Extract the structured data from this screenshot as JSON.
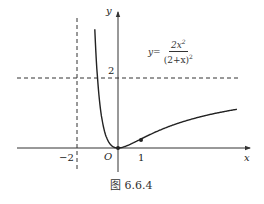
{
  "figure": {
    "caption": "图 6.6.4",
    "x_axis_label": "x",
    "y_axis_label": "y",
    "origin_label": "O",
    "tick_labels": {
      "x_neg2": "−2",
      "x_1": "1",
      "y_2": "2"
    },
    "formula": {
      "lhs": "y=",
      "numerator": "2x",
      "numerator_exp": "2",
      "denominator": "(2+x)",
      "denominator_exp": "2"
    },
    "colors": {
      "curve": "#222222",
      "axes": "#333333",
      "asymptote": "#333333"
    }
  },
  "chart_data": {
    "type": "line",
    "title": "",
    "caption": "图 6.6.4",
    "function": "y = 2x^2/(2+x)^2",
    "xlabel": "x",
    "ylabel": "y",
    "x_ticks": [
      -2,
      0,
      1
    ],
    "y_ticks": [
      2
    ],
    "asymptotes": {
      "vertical": [
        -2
      ],
      "horizontal": [
        2
      ]
    },
    "marked_points": [
      {
        "x": 0,
        "y": 0,
        "label": "O"
      },
      {
        "x": 1,
        "y": 0.2222
      }
    ],
    "series": [
      {
        "name": "left branch",
        "x": [
          -4.4,
          -4,
          -3.5,
          -3,
          -2.8,
          -2.6,
          -2.5
        ],
        "y": [
          2.69,
          4,
          5.44,
          18,
          24.5,
          37.6,
          50
        ]
      },
      {
        "name": "right branch",
        "x": [
          -1.5,
          -1.2,
          -1,
          -0.5,
          0,
          0.5,
          1,
          2,
          3,
          4,
          5.5
        ],
        "y": [
          18,
          4.5,
          2,
          0.22,
          0,
          0.08,
          0.22,
          0.5,
          0.72,
          0.89,
          1.07
        ]
      }
    ],
    "xlim": [
      -4.4,
      5.7
    ],
    "ylim": [
      -0.7,
      3.9
    ],
    "grid": false,
    "legend": "none"
  }
}
